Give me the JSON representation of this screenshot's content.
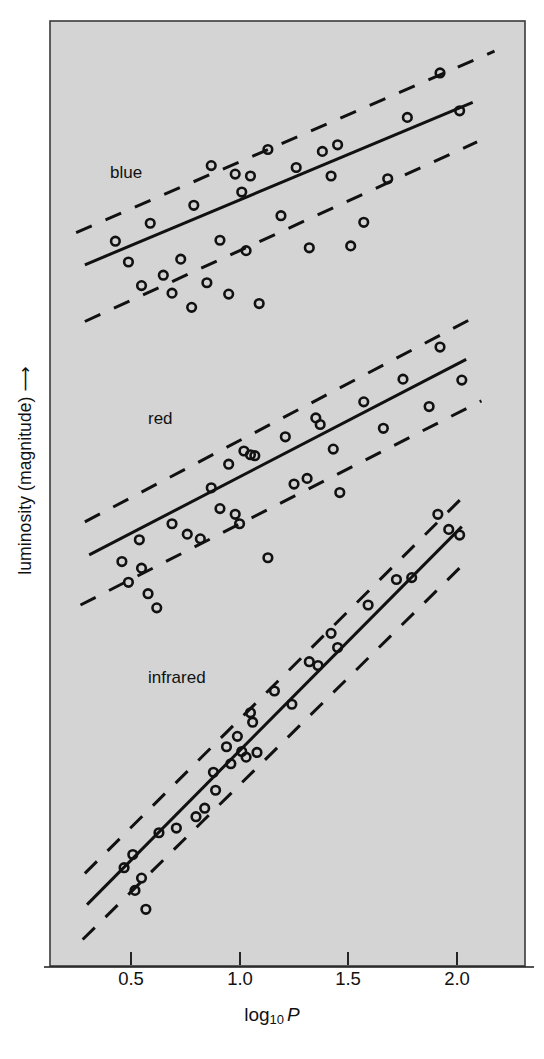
{
  "figure": {
    "plot_area": {
      "left": 50,
      "top": 21,
      "right": 525,
      "bottom": 966
    },
    "background_color": "#d4d4d4",
    "frame_color": "#3a3a3a",
    "ink_color": "#111111"
  },
  "axes": {
    "x_label_main": "log",
    "x_label_sub": "10",
    "x_label_var": "P",
    "y_label": "luminosity (magnitude) ⟶",
    "x_ticks": [
      {
        "value": 0.5,
        "label": "0.5",
        "px": 131
      },
      {
        "value": 1.0,
        "label": "1.0",
        "px": 240
      },
      {
        "value": 1.5,
        "label": "1.5",
        "px": 348
      },
      {
        "value": 2.0,
        "label": "2.0",
        "px": 457
      }
    ],
    "y_ticks": []
  },
  "series_labels": [
    {
      "name": "blue",
      "text": "blue",
      "x": 110,
      "y": 163
    },
    {
      "name": "red",
      "text": "red",
      "x": 148,
      "y": 409
    },
    {
      "name": "infrared",
      "text": "infrared",
      "x": 148,
      "y": 668
    }
  ],
  "chart_data": {
    "type": "scatter",
    "title": "",
    "subtitle": "",
    "xlabel": "log10 P",
    "ylabel": "luminosity (magnitude)",
    "xlim": [
      0.14,
      2.32
    ],
    "ylim": [
      0,
      1
    ],
    "grid": false,
    "legend": "inline-labels",
    "annotations": [
      "blue",
      "red",
      "infrared"
    ],
    "series": [
      {
        "name": "blue",
        "fit_line": {
          "x0": 0.3,
          "y0": 0.742,
          "x1": 2.08,
          "y1": 0.914,
          "style": "solid"
        },
        "dashed_upper": {
          "x0": 0.26,
          "y0": 0.776,
          "x1": 2.18,
          "y1": 0.968,
          "style": "dashed"
        },
        "dashed_lower": {
          "x0": 0.3,
          "y0": 0.682,
          "x1": 2.1,
          "y1": 0.872,
          "style": "dashed"
        },
        "points": [
          {
            "x": 0.44,
            "y": 0.767
          },
          {
            "x": 0.5,
            "y": 0.745
          },
          {
            "x": 0.56,
            "y": 0.72
          },
          {
            "x": 0.6,
            "y": 0.786
          },
          {
            "x": 0.66,
            "y": 0.731
          },
          {
            "x": 0.7,
            "y": 0.712
          },
          {
            "x": 0.74,
            "y": 0.748
          },
          {
            "x": 0.79,
            "y": 0.697
          },
          {
            "x": 0.8,
            "y": 0.805
          },
          {
            "x": 0.86,
            "y": 0.723
          },
          {
            "x": 0.88,
            "y": 0.847
          },
          {
            "x": 0.92,
            "y": 0.768
          },
          {
            "x": 0.96,
            "y": 0.711
          },
          {
            "x": 0.99,
            "y": 0.838
          },
          {
            "x": 1.02,
            "y": 0.819
          },
          {
            "x": 1.04,
            "y": 0.757
          },
          {
            "x": 1.06,
            "y": 0.836
          },
          {
            "x": 1.1,
            "y": 0.701
          },
          {
            "x": 1.14,
            "y": 0.864
          },
          {
            "x": 1.2,
            "y": 0.794
          },
          {
            "x": 1.27,
            "y": 0.845
          },
          {
            "x": 1.33,
            "y": 0.76
          },
          {
            "x": 1.39,
            "y": 0.862
          },
          {
            "x": 1.43,
            "y": 0.836
          },
          {
            "x": 1.46,
            "y": 0.869
          },
          {
            "x": 1.52,
            "y": 0.762
          },
          {
            "x": 1.58,
            "y": 0.787
          },
          {
            "x": 1.69,
            "y": 0.833
          },
          {
            "x": 1.78,
            "y": 0.898
          },
          {
            "x": 1.93,
            "y": 0.945
          },
          {
            "x": 2.02,
            "y": 0.905
          }
        ]
      },
      {
        "name": "red",
        "fit_line": {
          "x0": 0.32,
          "y0": 0.435,
          "x1": 2.05,
          "y1": 0.642,
          "style": "solid"
        },
        "dashed_upper": {
          "x0": 0.3,
          "y0": 0.47,
          "x1": 2.1,
          "y1": 0.688,
          "style": "dashed"
        },
        "dashed_lower": {
          "x0": 0.28,
          "y0": 0.382,
          "x1": 2.12,
          "y1": 0.598,
          "style": "dashed"
        },
        "points": [
          {
            "x": 0.47,
            "y": 0.428
          },
          {
            "x": 0.5,
            "y": 0.406
          },
          {
            "x": 0.55,
            "y": 0.451
          },
          {
            "x": 0.56,
            "y": 0.421
          },
          {
            "x": 0.59,
            "y": 0.394
          },
          {
            "x": 0.63,
            "y": 0.379
          },
          {
            "x": 0.7,
            "y": 0.468
          },
          {
            "x": 0.77,
            "y": 0.457
          },
          {
            "x": 0.83,
            "y": 0.452
          },
          {
            "x": 0.88,
            "y": 0.506
          },
          {
            "x": 0.92,
            "y": 0.484
          },
          {
            "x": 0.96,
            "y": 0.531
          },
          {
            "x": 0.99,
            "y": 0.478
          },
          {
            "x": 1.01,
            "y": 0.468
          },
          {
            "x": 1.03,
            "y": 0.545
          },
          {
            "x": 1.06,
            "y": 0.541
          },
          {
            "x": 1.08,
            "y": 0.54
          },
          {
            "x": 1.14,
            "y": 0.432
          },
          {
            "x": 1.22,
            "y": 0.56
          },
          {
            "x": 1.26,
            "y": 0.51
          },
          {
            "x": 1.32,
            "y": 0.516
          },
          {
            "x": 1.36,
            "y": 0.58
          },
          {
            "x": 1.38,
            "y": 0.573
          },
          {
            "x": 1.44,
            "y": 0.547
          },
          {
            "x": 1.47,
            "y": 0.501
          },
          {
            "x": 1.58,
            "y": 0.597
          },
          {
            "x": 1.67,
            "y": 0.569
          },
          {
            "x": 1.76,
            "y": 0.621
          },
          {
            "x": 1.88,
            "y": 0.592
          },
          {
            "x": 1.93,
            "y": 0.655
          },
          {
            "x": 2.03,
            "y": 0.62
          }
        ]
      },
      {
        "name": "infrared",
        "fit_line": {
          "x0": 0.31,
          "y0": 0.065,
          "x1": 2.03,
          "y1": 0.465,
          "style": "solid"
        },
        "dashed_upper": {
          "x0": 0.3,
          "y0": 0.098,
          "x1": 2.06,
          "y1": 0.502,
          "style": "dashed"
        },
        "dashed_lower": {
          "x0": 0.29,
          "y0": 0.028,
          "x1": 2.05,
          "y1": 0.428,
          "style": "dashed"
        },
        "points": [
          {
            "x": 0.48,
            "y": 0.104
          },
          {
            "x": 0.52,
            "y": 0.118
          },
          {
            "x": 0.53,
            "y": 0.08
          },
          {
            "x": 0.56,
            "y": 0.093
          },
          {
            "x": 0.58,
            "y": 0.06
          },
          {
            "x": 0.64,
            "y": 0.141
          },
          {
            "x": 0.72,
            "y": 0.146
          },
          {
            "x": 0.81,
            "y": 0.158
          },
          {
            "x": 0.85,
            "y": 0.167
          },
          {
            "x": 0.89,
            "y": 0.205
          },
          {
            "x": 0.9,
            "y": 0.186
          },
          {
            "x": 0.95,
            "y": 0.232
          },
          {
            "x": 0.97,
            "y": 0.214
          },
          {
            "x": 1.0,
            "y": 0.243
          },
          {
            "x": 1.02,
            "y": 0.227
          },
          {
            "x": 1.04,
            "y": 0.221
          },
          {
            "x": 1.06,
            "y": 0.268
          },
          {
            "x": 1.07,
            "y": 0.258
          },
          {
            "x": 1.09,
            "y": 0.226
          },
          {
            "x": 1.17,
            "y": 0.291
          },
          {
            "x": 1.25,
            "y": 0.277
          },
          {
            "x": 1.33,
            "y": 0.322
          },
          {
            "x": 1.37,
            "y": 0.318
          },
          {
            "x": 1.43,
            "y": 0.352
          },
          {
            "x": 1.46,
            "y": 0.337
          },
          {
            "x": 1.6,
            "y": 0.382
          },
          {
            "x": 1.73,
            "y": 0.409
          },
          {
            "x": 1.8,
            "y": 0.411
          },
          {
            "x": 1.92,
            "y": 0.478
          },
          {
            "x": 1.97,
            "y": 0.462
          },
          {
            "x": 2.02,
            "y": 0.456
          }
        ]
      }
    ]
  }
}
